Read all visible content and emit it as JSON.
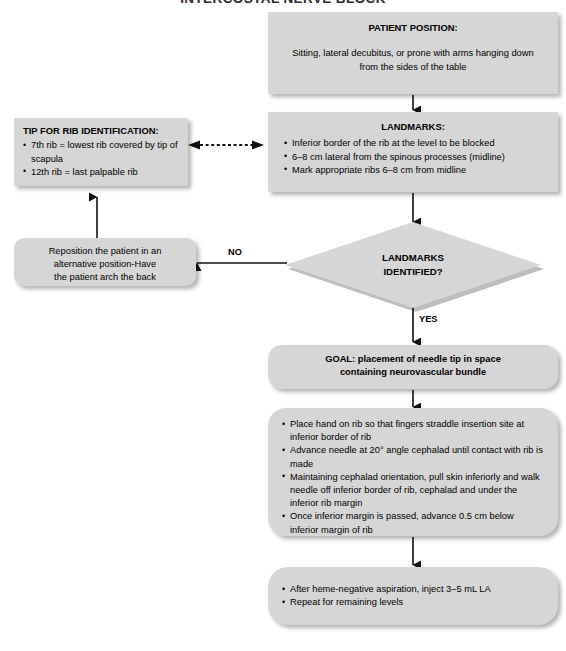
{
  "title": "INTERCOSTAL NERVE BLOCK",
  "nodes": {
    "patient_position": {
      "header": "PATIENT POSITION:",
      "line1": "Sitting, lateral decubitus, or prone with arms hanging down",
      "line2": "from the sides of the table"
    },
    "landmarks": {
      "header": "LANDMARKS:",
      "items": [
        "Inferior border of the rib at the level to be blocked",
        "6–8 cm lateral from the spinous processes (midline)",
        "Mark appropriate ribs 6–8 cm from midline"
      ]
    },
    "tip_rib_id": {
      "header": "TIP FOR RIB IDENTIFICATION:",
      "items": [
        "7th rib = lowest rib covered by tip of scapula",
        "12th rib = last palpable rib"
      ]
    },
    "reposition": {
      "line1": "Reposition the patient in an",
      "line2": "alternative position-Have",
      "line3": "the patient arch the back"
    },
    "decision": {
      "line1": "LANDMARKS",
      "line2": "IDENTIFIED?"
    },
    "goal": {
      "line1": "GOAL: placement of needle tip in space",
      "line2": "containing neurovascular bundle"
    },
    "technique": {
      "items": [
        "Place hand on rib so that fingers straddle insertion site at inferior border of rib",
        "Advance needle at 20° angle cephalad until contact with rib is made",
        "Maintaining cephalad orientation, pull skin inferiorly and walk needle off inferior border of rib, cephalad and under the inferior rib margin",
        "Once inferior margin is passed, advance 0.5 cm below inferior margin of rib"
      ]
    },
    "finish": {
      "items": [
        "After heme-negative aspiration, inject 3–5 mL LA",
        "Repeat for remaining levels"
      ]
    }
  },
  "edges": {
    "no_label": "NO",
    "yes_label": "YES"
  },
  "colors": {
    "node_fill": "#d6d6d6",
    "background": "#ffffff",
    "line": "#1a1a1a"
  }
}
